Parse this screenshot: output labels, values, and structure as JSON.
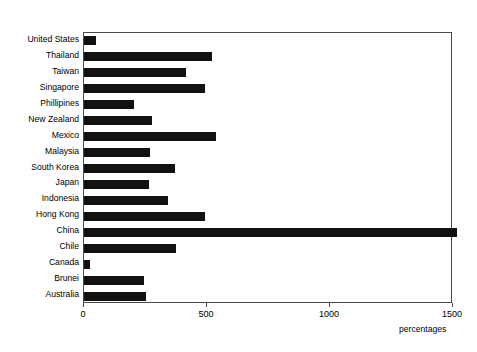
{
  "chart_data": {
    "type": "bar",
    "orientation": "horizontal",
    "title": "",
    "xlabel": "percentages",
    "ylabel": "",
    "xlim": [
      0,
      1500
    ],
    "xticks": [
      0,
      500,
      1000,
      1500
    ],
    "xtick_labels": [
      "0",
      "500",
      "1000",
      "1500"
    ],
    "grid": false,
    "legend": null,
    "bar_color": "#111111",
    "frame_color": "#4a4a4a",
    "categories": [
      "United States",
      "Thailand",
      "Taiwan",
      "Singapore",
      "Phillipines",
      "New Zealand",
      "Mexico",
      "Malaysia",
      "South Korea",
      "Japan",
      "Indonesia",
      "Hong Kong",
      "China",
      "Chile",
      "Canada",
      "Brunei",
      "Australia"
    ],
    "values": [
      50,
      520,
      415,
      490,
      205,
      275,
      535,
      270,
      370,
      265,
      340,
      490,
      1515,
      375,
      25,
      245,
      250
    ]
  }
}
